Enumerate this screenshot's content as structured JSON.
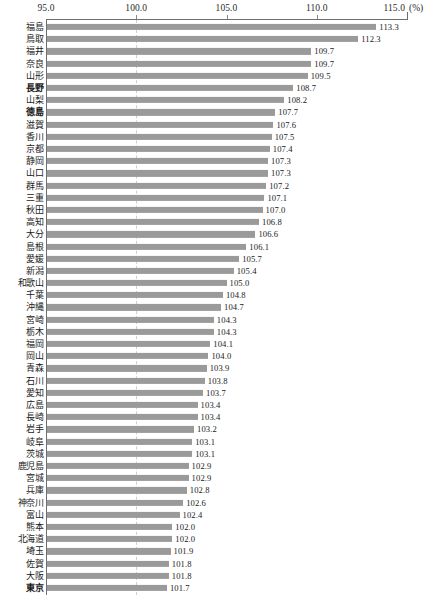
{
  "chart_data": {
    "type": "bar",
    "orientation": "horizontal",
    "title": "",
    "xlabel": "(%)",
    "ylabel": "",
    "xlim": [
      95.0,
      115.0
    ],
    "grid": false,
    "reference_line": 100.0,
    "legend": "none",
    "axis_unit": "(%)",
    "tick_labels": [
      "95.0",
      "100.0",
      "105.0",
      "110.0",
      "115.0"
    ],
    "tick_values": [
      95.0,
      100.0,
      105.0,
      110.0,
      115.0
    ],
    "bar_color": "#9a9a9a",
    "axis_color": "#6e6e6e",
    "emphasized": [
      "長野",
      "徳島",
      "東京"
    ],
    "categories": [
      "福島",
      "鳥取",
      "福井",
      "奈良",
      "山形",
      "長野",
      "山梨",
      "徳島",
      "滋賀",
      "香川",
      "京都",
      "静岡",
      "山口",
      "群馬",
      "三重",
      "秋田",
      "高知",
      "大分",
      "島根",
      "愛媛",
      "新潟",
      "和歌山",
      "千葉",
      "沖縄",
      "宮崎",
      "栃木",
      "福岡",
      "岡山",
      "青森",
      "石川",
      "愛知",
      "広島",
      "長崎",
      "岩手",
      "岐阜",
      "茨城",
      "鹿児島",
      "宮城",
      "兵庫",
      "神奈川",
      "富山",
      "熊本",
      "北海道",
      "埼玉",
      "佐賀",
      "大阪",
      "東京"
    ],
    "values": [
      113.3,
      112.3,
      109.7,
      109.7,
      109.5,
      108.7,
      108.2,
      107.7,
      107.6,
      107.5,
      107.4,
      107.3,
      107.3,
      107.2,
      107.1,
      107.0,
      106.8,
      106.6,
      106.1,
      105.7,
      105.4,
      105.0,
      104.8,
      104.7,
      104.3,
      104.3,
      104.1,
      104.0,
      103.9,
      103.8,
      103.7,
      103.4,
      103.4,
      103.2,
      103.1,
      103.1,
      102.9,
      102.9,
      102.8,
      102.6,
      102.4,
      102.0,
      102.0,
      101.9,
      101.8,
      101.8,
      101.7
    ],
    "value_labels": [
      "113.3",
      "112.3",
      "109.7",
      "109.7",
      "109.5",
      "108.7",
      "108.2",
      "107.7",
      "107.6",
      "107.5",
      "107.4",
      "107.3",
      "107.3",
      "107.2",
      "107.1",
      "107.0",
      "106.8",
      "106.6",
      "106.1",
      "105.7",
      "105.4",
      "105.0",
      "104.8",
      "104.7",
      "104.3",
      "104.3",
      "104.1",
      "104.0",
      "103.9",
      "103.8",
      "103.7",
      "103.4",
      "103.4",
      "103.2",
      "103.1",
      "103.1",
      "102.9",
      "102.9",
      "102.8",
      "102.6",
      "102.4",
      "102.0",
      "102.0",
      "101.9",
      "101.8",
      "101.8",
      "101.7"
    ]
  }
}
